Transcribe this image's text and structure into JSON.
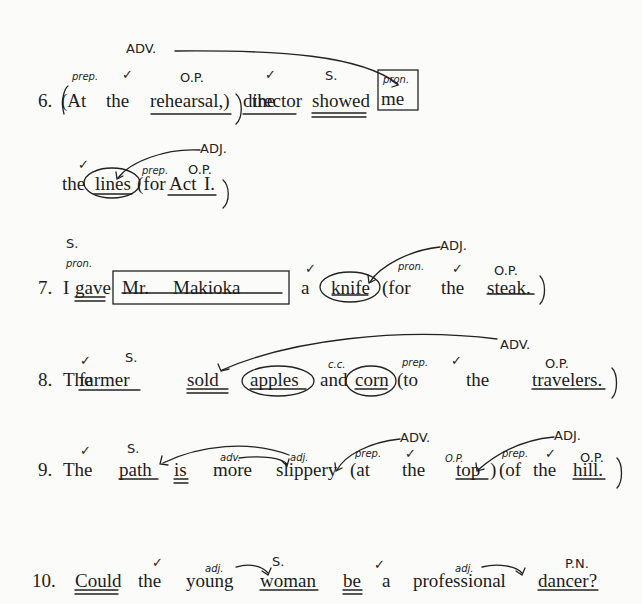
{
  "sentences": [
    {
      "number": "6.",
      "words": [
        "(At",
        "the",
        "rehearsal,)",
        "the",
        "director",
        "showed",
        "me",
        "the",
        "lines",
        "(for",
        "Act",
        "I.",
        ")"
      ],
      "annotations": {
        "prep": "prep.",
        "op1": "O.P.",
        "s": "S.",
        "pron": "pron.",
        "adv": "ADV.",
        "adj": "ADJ.",
        "prep2": "prep.",
        "op2": "O.P.",
        "check": "✓"
      }
    },
    {
      "number": "7.",
      "words": [
        "I",
        "gave",
        "Mr.",
        "Makioka",
        "a",
        "knife",
        "(for",
        "the",
        "steak.",
        ")"
      ],
      "annotations": {
        "s": "S.",
        "pron": "pron.",
        "adj": "ADJ.",
        "pron2": "pron.",
        "op": "O.P.",
        "check": "✓"
      }
    },
    {
      "number": "8.",
      "words": [
        "The",
        "farmer",
        "sold",
        "apples",
        "and",
        "corn",
        "(to",
        "the",
        "travelers.",
        ")"
      ],
      "annotations": {
        "s": "S.",
        "cc": "c.c.",
        "prep": "prep.",
        "op": "O.P.",
        "adv": "ADV.",
        "check": "✓"
      }
    },
    {
      "number": "9.",
      "words": [
        "The",
        "path",
        "is",
        "more",
        "slippery",
        "(at",
        "the",
        "top",
        ")",
        "(of",
        "the",
        "hill.",
        ")"
      ],
      "annotations": {
        "s": "S.",
        "adv_small": "adv.",
        "adj_small": "adj.",
        "adv": "ADV.",
        "adj": "ADJ.",
        "prep1": "prep.",
        "op1": "O.P.",
        "prep2": "prep.",
        "op2": "O.P.",
        "check": "✓"
      }
    },
    {
      "number": "10.",
      "words": [
        "Could",
        "the",
        "young",
        "woman",
        "be",
        "a",
        "professional",
        "dancer?"
      ],
      "annotations": {
        "adj1": "adj.",
        "s": "S.",
        "adj2": "adj.",
        "pn": "P.N.",
        "check": "✓"
      }
    }
  ]
}
